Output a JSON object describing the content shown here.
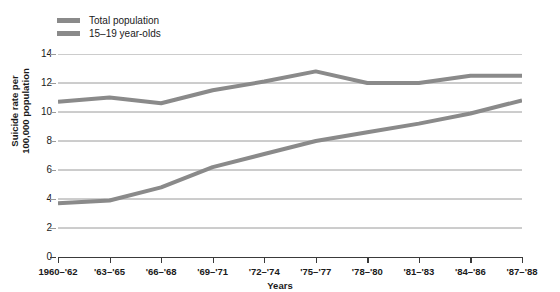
{
  "chart_data": {
    "type": "line",
    "title": "",
    "xlabel": "Years",
    "ylabel": "Suicide rate per 100,000 population",
    "ylabel_line1": "Suicide rate per",
    "ylabel_line2": "100,000 population",
    "categories": [
      "1960–'62",
      "'63–'65",
      "'66–'68",
      "'69–'71",
      "'72–'74",
      "'75–'77",
      "'78–'80",
      "'81–'83",
      "'84–'86",
      "'87–'88"
    ],
    "ylim": [
      0,
      14
    ],
    "ytick_labels": [
      "14",
      "12",
      "10",
      "8",
      "6",
      "4",
      "2",
      "0"
    ],
    "yticks": [
      14,
      12,
      10,
      8,
      6,
      4,
      2,
      0
    ],
    "grid": "horizontal",
    "legend_position": "top-left",
    "series": [
      {
        "name": "Total population",
        "color": "#8a8a8a",
        "values": [
          10.7,
          11.0,
          10.6,
          11.5,
          12.1,
          12.8,
          12.0,
          12.0,
          12.5,
          12.5
        ]
      },
      {
        "name": "15–19 year-olds",
        "color": "#8a8a8a",
        "values": [
          3.7,
          3.9,
          4.8,
          6.2,
          7.1,
          8.0,
          8.6,
          9.2,
          9.9,
          10.8
        ]
      }
    ]
  },
  "colors": {
    "series_gray": "#8a8a8a",
    "gridline": "#9a9a9a",
    "axis": "#3a3a3a",
    "text": "#1a1a1a",
    "background": "#ffffff"
  }
}
